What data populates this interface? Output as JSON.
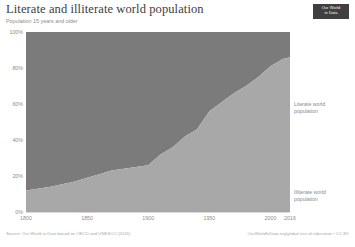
{
  "header": {
    "title": "Literate and illiterate world population",
    "subtitle": "Population 15 years and older",
    "logo_line1": "Our World",
    "logo_line2": "in Data"
  },
  "footer": {
    "source": "Source: Our World in Data based on OECD and UNESCO (2016)",
    "attribution": "OurWorldInData.org/global-rise-of-education • CC BY"
  },
  "colors": {
    "illiterate": "#7b7b7b",
    "literate": "#a8a8a8",
    "axis_text": "#8d8d8d",
    "title_text": "#3d3d3d",
    "logo_bg": "#3f3f3f"
  },
  "chart_data": {
    "type": "area",
    "title": "Literate and illiterate world population",
    "subtitle": "Population 15 years and older",
    "xlabel": "",
    "ylabel": "",
    "stacked": true,
    "normalized": true,
    "grid": false,
    "legend_position": "inline-right",
    "xlim": [
      1800,
      2016
    ],
    "ylim": [
      0,
      100
    ],
    "yticks": [
      "0%",
      "20%",
      "40%",
      "60%",
      "80%",
      "100%"
    ],
    "ytick_values": [
      0,
      20,
      40,
      60,
      80,
      100
    ],
    "xticks": [
      "1800",
      "1850",
      "1900",
      "1950",
      "2000",
      "2016"
    ],
    "xtick_values": [
      1800,
      1850,
      1900,
      1950,
      2000,
      2016
    ],
    "x": [
      1800,
      1820,
      1840,
      1850,
      1860,
      1870,
      1880,
      1890,
      1900,
      1910,
      1920,
      1930,
      1940,
      1950,
      1960,
      1970,
      1980,
      1990,
      2000,
      2010,
      2016
    ],
    "series": [
      {
        "name": "Literate world population",
        "color": "#a8a8a8",
        "values": [
          12,
          14,
          17,
          19,
          21,
          23,
          24,
          25,
          26,
          32,
          36,
          42,
          46,
          56,
          61,
          66,
          70,
          75,
          81,
          85,
          86
        ]
      },
      {
        "name": "Illiterate world population",
        "color": "#7b7b7b",
        "values": [
          88,
          86,
          83,
          81,
          79,
          77,
          76,
          75,
          74,
          68,
          64,
          58,
          54,
          44,
          39,
          34,
          30,
          25,
          19,
          15,
          14
        ]
      }
    ],
    "annotations": [
      {
        "text": "Literate world population",
        "x": 2016,
        "y": 45
      },
      {
        "text": "Illiterate world population",
        "x": 2016,
        "y": 7
      }
    ]
  }
}
